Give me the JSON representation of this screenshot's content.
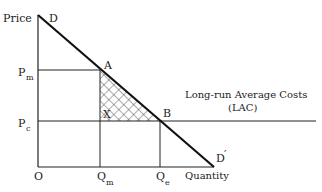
{
  "diagram": {
    "axes": {
      "y_label": "Price",
      "x_label": "Quantity",
      "origin_label": "O"
    },
    "curves": {
      "demand_start_label": "D",
      "demand_end_label": "D",
      "demand_end_prime": "′",
      "lac_label_line1": "Long-run Average Costs",
      "lac_label_line2": "(LAC)"
    },
    "points": {
      "a": "A",
      "b": "B",
      "x": "X"
    },
    "price_ticks": {
      "pm_main": "P",
      "pm_sub": "m",
      "pc_main": "P",
      "pc_sub": "c"
    },
    "quantity_ticks": {
      "qm_main": "Q",
      "qm_sub": "m",
      "qe_main": "Q",
      "qe_sub": "e"
    },
    "colors": {
      "line": "#222222",
      "hatch": "#333333"
    }
  }
}
